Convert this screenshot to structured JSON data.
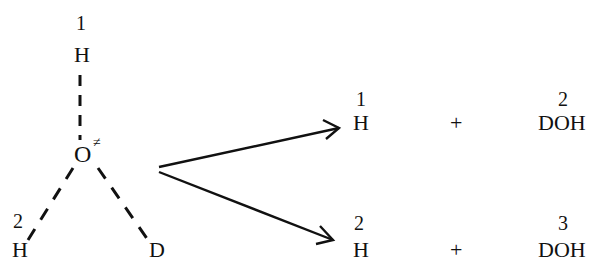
{
  "diagram": {
    "type": "reaction-scheme",
    "transition_state": {
      "central_atom": "O",
      "central_atom_superscript": "≠",
      "atoms": [
        {
          "id": "top-h",
          "symbol": "H",
          "label": "1",
          "bond": "dashed"
        },
        {
          "id": "left-h",
          "symbol": "H",
          "label": "2",
          "bond": "dashed"
        },
        {
          "id": "right-d",
          "symbol": "D",
          "label": "",
          "bond": "dashed"
        }
      ]
    },
    "products": [
      {
        "channel": "upper",
        "left": {
          "symbol": "H",
          "label": "1"
        },
        "operator": "+",
        "right": {
          "symbol": "DOH",
          "label": "2"
        }
      },
      {
        "channel": "lower",
        "left": {
          "symbol": "H",
          "label": "2"
        },
        "operator": "+",
        "right": {
          "symbol": "DOH",
          "label": "3"
        }
      }
    ],
    "colors": {
      "ink": "#111111",
      "background": "#ffffff"
    }
  }
}
